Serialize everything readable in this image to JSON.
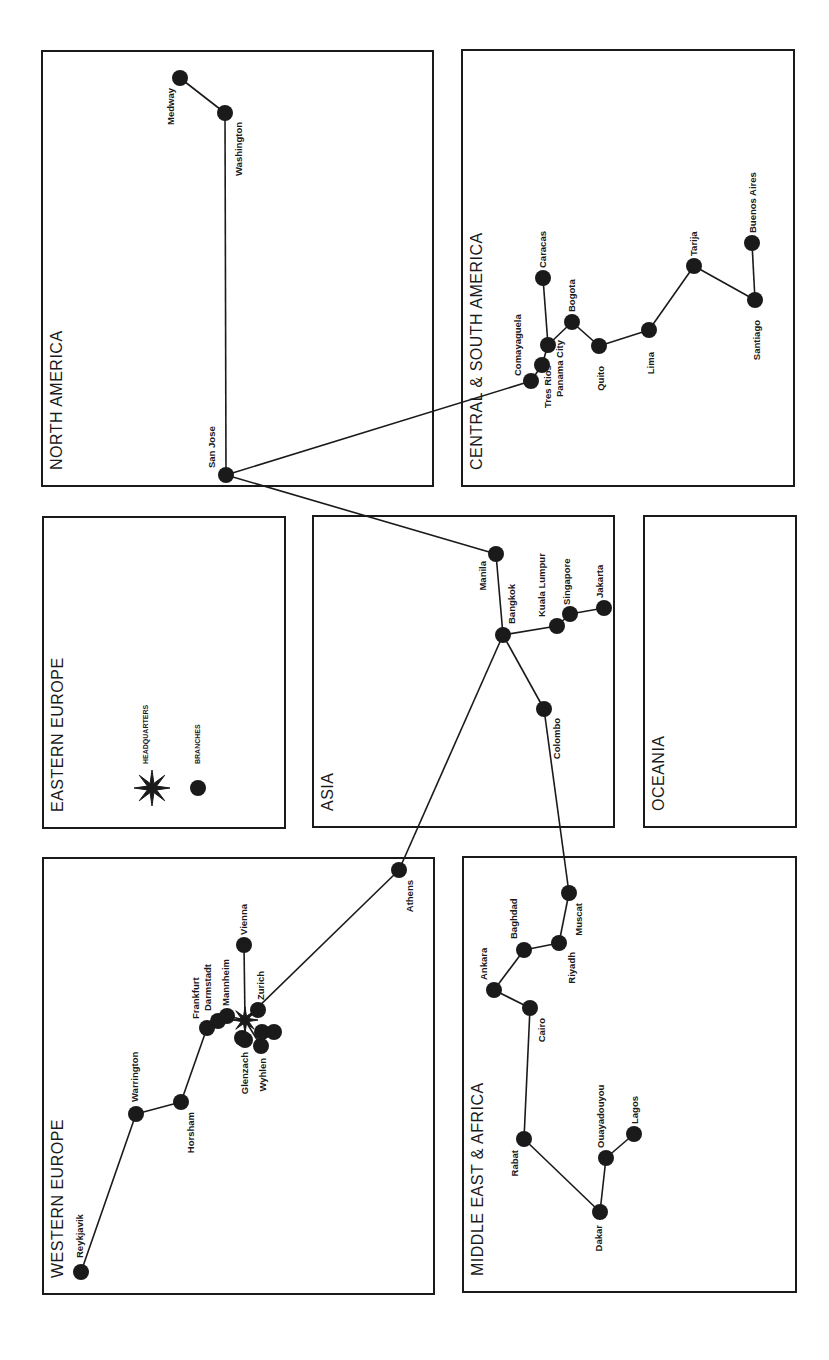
{
  "colors": {
    "ink": "#1a1a1a",
    "background": "#ffffff"
  },
  "regions": [
    {
      "id": "north-america",
      "label": "NORTH AMERICA",
      "x": 42,
      "y": 51,
      "w": 391,
      "h": 435,
      "label_x": 62,
      "label_y": 470
    },
    {
      "id": "central-south-america",
      "label": "CENTRAL & SOUTH AMERICA",
      "x": 462,
      "y": 50,
      "w": 332,
      "h": 436,
      "label_x": 482,
      "label_y": 470
    },
    {
      "id": "eastern-europe",
      "label": "EASTERN EUROPE",
      "x": 43,
      "y": 517,
      "w": 242,
      "h": 311,
      "label_x": 63,
      "label_y": 812
    },
    {
      "id": "asia",
      "label": "ASIA",
      "x": 313,
      "y": 516,
      "w": 301,
      "h": 311,
      "label_x": 333,
      "label_y": 811
    },
    {
      "id": "oceania",
      "label": "OCEANIA",
      "x": 644,
      "y": 516,
      "w": 152,
      "h": 311,
      "label_x": 664,
      "label_y": 811
    },
    {
      "id": "western-europe",
      "label": "WESTERN EUROPE",
      "x": 43,
      "y": 858,
      "w": 391,
      "h": 436,
      "label_x": 63,
      "label_y": 1278
    },
    {
      "id": "middle-east-africa",
      "label": "MIDDLE EAST & AFRICA",
      "x": 463,
      "y": 857,
      "w": 333,
      "h": 435,
      "label_x": 483,
      "label_y": 1276
    }
  ],
  "legend": {
    "headquarters_label": "HEADQUARTERS",
    "branches_label": "BRANCHES",
    "hq_icon": "star-icon",
    "branch_icon": "dot-icon",
    "hq_x": 152,
    "hq_y": 788,
    "branch_x": 198,
    "branch_y": 788
  },
  "headquarters": {
    "x": 245,
    "y": 1020
  },
  "cities": [
    {
      "name": "Medway",
      "x": 180,
      "y": 78,
      "lx": 174,
      "ly": 88,
      "anchor": "end",
      "region": "north-america"
    },
    {
      "name": "Washington",
      "x": 225,
      "y": 113,
      "lx": 242,
      "ly": 122,
      "anchor": "end",
      "region": "north-america"
    },
    {
      "name": "San Jose",
      "x": 226,
      "y": 475,
      "lx": 215,
      "ly": 468,
      "anchor": "start",
      "region": "north-america"
    },
    {
      "name": "Comayaguela",
      "x": 531,
      "y": 381,
      "lx": 521,
      "ly": 376,
      "anchor": "start",
      "region": "central-south-america"
    },
    {
      "name": "Tres Rios",
      "x": 542,
      "y": 365,
      "lx": 551,
      "ly": 408,
      "anchor": "start",
      "region": "central-south-america"
    },
    {
      "name": "Panama City",
      "x": 548,
      "y": 345,
      "lx": 563,
      "ly": 397,
      "anchor": "start",
      "region": "central-south-america"
    },
    {
      "name": "Caracas",
      "x": 543,
      "y": 278,
      "lx": 546,
      "ly": 268,
      "anchor": "start",
      "region": "central-south-america"
    },
    {
      "name": "Bogota",
      "x": 572,
      "y": 322,
      "lx": 575,
      "ly": 312,
      "anchor": "start",
      "region": "central-south-america"
    },
    {
      "name": "Quito",
      "x": 599,
      "y": 346,
      "lx": 604,
      "ly": 366,
      "anchor": "end",
      "region": "central-south-america"
    },
    {
      "name": "Lima",
      "x": 649,
      "y": 330,
      "lx": 654,
      "ly": 352,
      "anchor": "end",
      "region": "central-south-america"
    },
    {
      "name": "Tarija",
      "x": 694,
      "y": 266,
      "lx": 697,
      "ly": 256,
      "anchor": "start",
      "region": "central-south-america"
    },
    {
      "name": "Santiago",
      "x": 755,
      "y": 300,
      "lx": 760,
      "ly": 320,
      "anchor": "end",
      "region": "central-south-america"
    },
    {
      "name": "Buenos Aires",
      "x": 752,
      "y": 243,
      "lx": 756,
      "ly": 233,
      "anchor": "start",
      "region": "central-south-america"
    },
    {
      "name": "Manila",
      "x": 496,
      "y": 554,
      "lx": 486,
      "ly": 561,
      "anchor": "end",
      "region": "asia"
    },
    {
      "name": "Bangkok",
      "x": 503,
      "y": 635,
      "lx": 515,
      "ly": 624,
      "anchor": "start",
      "region": "asia"
    },
    {
      "name": "Kuala Lumpur",
      "x": 557,
      "y": 626,
      "lx": 545,
      "ly": 617,
      "anchor": "start",
      "region": "asia"
    },
    {
      "name": "Singapore",
      "x": 570,
      "y": 614,
      "lx": 570,
      "ly": 605,
      "anchor": "start",
      "region": "asia"
    },
    {
      "name": "Jakarta",
      "x": 604,
      "y": 608,
      "lx": 603,
      "ly": 598,
      "anchor": "start",
      "region": "asia"
    },
    {
      "name": "Colombo",
      "x": 544,
      "y": 709,
      "lx": 560,
      "ly": 718,
      "anchor": "end",
      "region": "asia"
    },
    {
      "name": "Reykjavik",
      "x": 81,
      "y": 1272,
      "lx": 83,
      "ly": 1258,
      "anchor": "start",
      "region": "western-europe"
    },
    {
      "name": "Warrington",
      "x": 136,
      "y": 1114,
      "lx": 138,
      "ly": 1102,
      "anchor": "start",
      "region": "western-europe"
    },
    {
      "name": "Horsham",
      "x": 181,
      "y": 1102,
      "lx": 194,
      "ly": 1112,
      "anchor": "end",
      "region": "western-europe"
    },
    {
      "name": "Frankfurt",
      "x": 207,
      "y": 1028,
      "lx": 199,
      "ly": 1019,
      "anchor": "start",
      "region": "western-europe"
    },
    {
      "name": "Darmstadt",
      "x": 218,
      "y": 1021,
      "lx": 211,
      "ly": 1011,
      "anchor": "start",
      "region": "western-europe"
    },
    {
      "name": "Mannheim",
      "x": 227,
      "y": 1016,
      "lx": 229,
      "ly": 1006,
      "anchor": "start",
      "region": "western-europe"
    },
    {
      "name": "Vienna",
      "x": 244,
      "y": 945,
      "lx": 247,
      "ly": 935,
      "anchor": "start",
      "region": "western-europe"
    },
    {
      "name": "Zurich",
      "x": 258,
      "y": 1010,
      "lx": 264,
      "ly": 1000,
      "anchor": "start",
      "region": "western-europe"
    },
    {
      "name": "Glenzach",
      "x": 245,
      "y": 1040,
      "lx": 248,
      "ly": 1052,
      "anchor": "end",
      "region": "western-europe"
    },
    {
      "name": "Wyhlen",
      "x": 261,
      "y": 1046,
      "lx": 266,
      "ly": 1058,
      "anchor": "end",
      "region": "western-europe"
    },
    {
      "name": "Athens",
      "x": 399,
      "y": 870,
      "lx": 413,
      "ly": 880,
      "anchor": "end",
      "region": "western-europe"
    },
    {
      "name": "Muscat",
      "x": 569,
      "y": 893,
      "lx": 582,
      "ly": 903,
      "anchor": "end",
      "region": "middle-east-africa"
    },
    {
      "name": "Riyadh",
      "x": 559,
      "y": 943,
      "lx": 575,
      "ly": 952,
      "anchor": "end",
      "region": "middle-east-africa"
    },
    {
      "name": "Baghdad",
      "x": 524,
      "y": 950,
      "lx": 517,
      "ly": 939,
      "anchor": "start",
      "region": "middle-east-africa"
    },
    {
      "name": "Ankara",
      "x": 494,
      "y": 990,
      "lx": 487,
      "ly": 980,
      "anchor": "start",
      "region": "middle-east-africa"
    },
    {
      "name": "Cairo",
      "x": 530,
      "y": 1008,
      "lx": 545,
      "ly": 1018,
      "anchor": "end",
      "region": "middle-east-africa"
    },
    {
      "name": "Rabat",
      "x": 524,
      "y": 1139,
      "lx": 518,
      "ly": 1150,
      "anchor": "end",
      "region": "middle-east-africa"
    },
    {
      "name": "Ouayadouyou",
      "x": 606,
      "y": 1158,
      "lx": 604,
      "ly": 1148,
      "anchor": "start",
      "region": "middle-east-africa"
    },
    {
      "name": "Lagos",
      "x": 634,
      "y": 1134,
      "lx": 638,
      "ly": 1124,
      "anchor": "start",
      "region": "middle-east-africa"
    },
    {
      "name": "Dakar",
      "x": 600,
      "y": 1212,
      "lx": 602,
      "ly": 1225,
      "anchor": "end",
      "region": "middle-east-africa"
    }
  ],
  "extra_branch_dots": [
    {
      "x": 262,
      "y": 1032
    },
    {
      "x": 274,
      "y": 1032
    },
    {
      "x": 242,
      "y": 1038
    }
  ],
  "links": [
    [
      "Medway",
      "Washington"
    ],
    [
      "Washington",
      "San Jose"
    ],
    [
      "San Jose",
      "Comayaguela"
    ],
    [
      "Comayaguela",
      "Tres Rios"
    ],
    [
      "Tres Rios",
      "Panama City"
    ],
    [
      "Panama City",
      "Caracas"
    ],
    [
      "Panama City",
      "Bogota"
    ],
    [
      "Bogota",
      "Quito"
    ],
    [
      "Quito",
      "Lima"
    ],
    [
      "Lima",
      "Tarija"
    ],
    [
      "Tarija",
      "Santiago"
    ],
    [
      "Santiago",
      "Buenos Aires"
    ],
    [
      "San Jose",
      "Manila"
    ],
    [
      "Manila",
      "Bangkok"
    ],
    [
      "Bangkok",
      "Kuala Lumpur"
    ],
    [
      "Kuala Lumpur",
      "Singapore"
    ],
    [
      "Singapore",
      "Jakarta"
    ],
    [
      "Bangkok",
      "Colombo"
    ],
    [
      "Bangkok",
      "Athens"
    ],
    [
      "Colombo",
      "Muscat"
    ],
    [
      "Muscat",
      "Riyadh"
    ],
    [
      "Riyadh",
      "Baghdad"
    ],
    [
      "Baghdad",
      "Ankara"
    ],
    [
      "Ankara",
      "Cairo"
    ],
    [
      "Cairo",
      "Rabat"
    ],
    [
      "Rabat",
      "Dakar"
    ],
    [
      "Dakar",
      "Ouayadouyou"
    ],
    [
      "Ouayadouyou",
      "Lagos"
    ],
    [
      "Athens",
      "HQ"
    ],
    [
      "HQ",
      "Vienna"
    ],
    [
      "HQ",
      "Zurich"
    ],
    [
      "HQ",
      "Mannheim"
    ],
    [
      "Mannheim",
      "Darmstadt"
    ],
    [
      "Darmstadt",
      "Frankfurt"
    ],
    [
      "Frankfurt",
      "Horsham"
    ],
    [
      "Horsham",
      "Warrington"
    ],
    [
      "Warrington",
      "Reykjavik"
    ],
    [
      "HQ",
      "Glenzach"
    ],
    [
      "HQ",
      "Wyhlen"
    ]
  ]
}
